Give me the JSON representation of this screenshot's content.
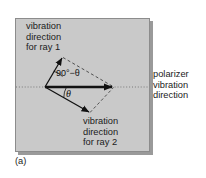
{
  "figure": {
    "caption": "(a)",
    "panel": {
      "fill_color": "#c9c9c9",
      "border_color": "#8c8c8c"
    },
    "labels": {
      "ray1": {
        "line1": "vibration",
        "line2": "direction",
        "line3": "for ray 1"
      },
      "ray2": {
        "line1": "vibration",
        "line2": "direction",
        "line3": "for ray 2"
      },
      "polarizer": {
        "line1": "polarizer",
        "line2": "vibration",
        "line3": "direction"
      }
    },
    "angles": {
      "large": "90°−θ",
      "large_value": "90° − θ",
      "small": "θ",
      "small_value": "θ"
    },
    "vectors": {
      "polarizer_axis": {
        "name": "polarizer vibration direction",
        "from": [
          45,
          87
        ],
        "to": [
          113,
          87
        ],
        "style": "solid-bold-arrow",
        "color": "#111111"
      },
      "ray1": {
        "name": "vibration direction for ray 1",
        "from": [
          45,
          87
        ],
        "to": [
          62,
          57
        ],
        "style": "solid-thin-arrow",
        "color": "#111111"
      },
      "ray2": {
        "name": "vibration direction for ray 2",
        "from": [
          45,
          87
        ],
        "to": [
          90,
          113
        ],
        "style": "solid-thin-arrow",
        "color": "#111111"
      },
      "construction_ray1_to_tip": {
        "name": "dashed component line from ray 1 tip",
        "from": [
          62,
          57
        ],
        "to": [
          113,
          87
        ],
        "style": "dashed-thin"
      },
      "construction_ray2_to_tip": {
        "name": "dashed component line from ray 2 tip",
        "from": [
          90,
          113
        ],
        "to": [
          113,
          87
        ],
        "style": "dashed-thin"
      },
      "axis_dotted": {
        "name": "horizontal dotted reference axis",
        "from": [
          16,
          87
        ],
        "to": [
          149,
          87
        ],
        "style": "dotted-thin"
      }
    }
  }
}
